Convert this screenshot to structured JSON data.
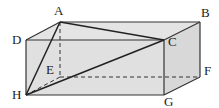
{
  "diagram": {
    "type": "rectangular-prism",
    "colors": {
      "face_fill": "#e0e0e0",
      "edge": "#333333",
      "diagonal": "#222222",
      "hidden": "#333333",
      "label": "#222222"
    },
    "vertices": {
      "A": {
        "label": "A",
        "x": 60,
        "y": 22,
        "lx": 54,
        "ly": 15
      },
      "B": {
        "label": "B",
        "x": 200,
        "y": 22,
        "lx": 201,
        "ly": 17
      },
      "C": {
        "label": "C",
        "x": 164,
        "y": 40,
        "lx": 168,
        "ly": 46
      },
      "D": {
        "label": "D",
        "x": 26,
        "y": 40,
        "lx": 12,
        "ly": 44
      },
      "E": {
        "label": "E",
        "x": 60,
        "y": 77,
        "lx": 46,
        "ly": 74
      },
      "F": {
        "label": "F",
        "x": 200,
        "y": 77,
        "lx": 204,
        "ly": 75
      },
      "G": {
        "label": "G",
        "x": 164,
        "y": 95,
        "lx": 164,
        "ly": 106
      },
      "H": {
        "label": "H",
        "x": 26,
        "y": 95,
        "lx": 12,
        "ly": 99
      }
    },
    "visible_edges": [
      [
        "A",
        "B"
      ],
      [
        "A",
        "D"
      ],
      [
        "B",
        "C"
      ],
      [
        "D",
        "C"
      ],
      [
        "D",
        "H"
      ],
      [
        "C",
        "G"
      ],
      [
        "H",
        "G"
      ],
      [
        "G",
        "F"
      ],
      [
        "B",
        "F"
      ]
    ],
    "hidden_edges": [
      [
        "A",
        "E"
      ],
      [
        "E",
        "F"
      ],
      [
        "E",
        "H"
      ]
    ],
    "diagonals": [
      [
        "A",
        "C"
      ],
      [
        "A",
        "H"
      ],
      [
        "H",
        "C"
      ]
    ]
  }
}
